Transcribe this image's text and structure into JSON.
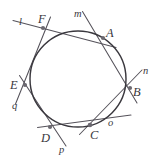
{
  "figure": {
    "kind": "circumscribed-hexagon-diagram",
    "width": 158,
    "height": 163,
    "background_color": "#ffffff",
    "circle": {
      "center_x": 78,
      "center_y": 79,
      "radius": 48,
      "stroke_color": "#3a383e"
    },
    "line_stroke_color": "#55525a",
    "vertex_dot_color": "#6b6870",
    "vertex_labels": [
      {
        "id": "A",
        "text": "A",
        "left": 106,
        "top": 27
      },
      {
        "id": "B",
        "text": "B",
        "left": 133,
        "top": 86
      },
      {
        "id": "C",
        "text": "C",
        "left": 90,
        "top": 129
      },
      {
        "id": "D",
        "text": "D",
        "left": 41,
        "top": 132
      },
      {
        "id": "E",
        "text": "E",
        "left": 10,
        "top": 79
      },
      {
        "id": "F",
        "text": "F",
        "left": 38,
        "top": 13
      }
    ],
    "line_labels": [
      {
        "id": "l",
        "text": "l",
        "left": 19,
        "top": 17
      },
      {
        "id": "m",
        "text": "m",
        "left": 74,
        "top": 9
      },
      {
        "id": "n",
        "text": "n",
        "left": 143,
        "top": 66
      },
      {
        "id": "o",
        "text": "o",
        "left": 108,
        "top": 118
      },
      {
        "id": "p",
        "text": "p",
        "left": 59,
        "top": 145
      },
      {
        "id": "q",
        "text": "q",
        "left": 12,
        "top": 101
      }
    ],
    "tangent_lines": [
      {
        "id": "l",
        "x1": 13,
        "y1": 21,
        "x2": 78,
        "y2": 44
      },
      {
        "id": "m",
        "x1": 82,
        "y1": 12,
        "x2": 122,
        "y2": 48
      },
      {
        "id": "n",
        "x1": 141,
        "y1": 71,
        "x2": 106,
        "y2": 132
      },
      {
        "id": "o",
        "x1": 132,
        "y1": 112,
        "x2": 68,
        "y2": 137
      },
      {
        "id": "p",
        "x1": 65,
        "y1": 143,
        "x2": 28,
        "y2": 104
      },
      {
        "id": "q",
        "x1": 18,
        "y1": 98,
        "x2": 38,
        "y2": 57
      }
    ]
  }
}
